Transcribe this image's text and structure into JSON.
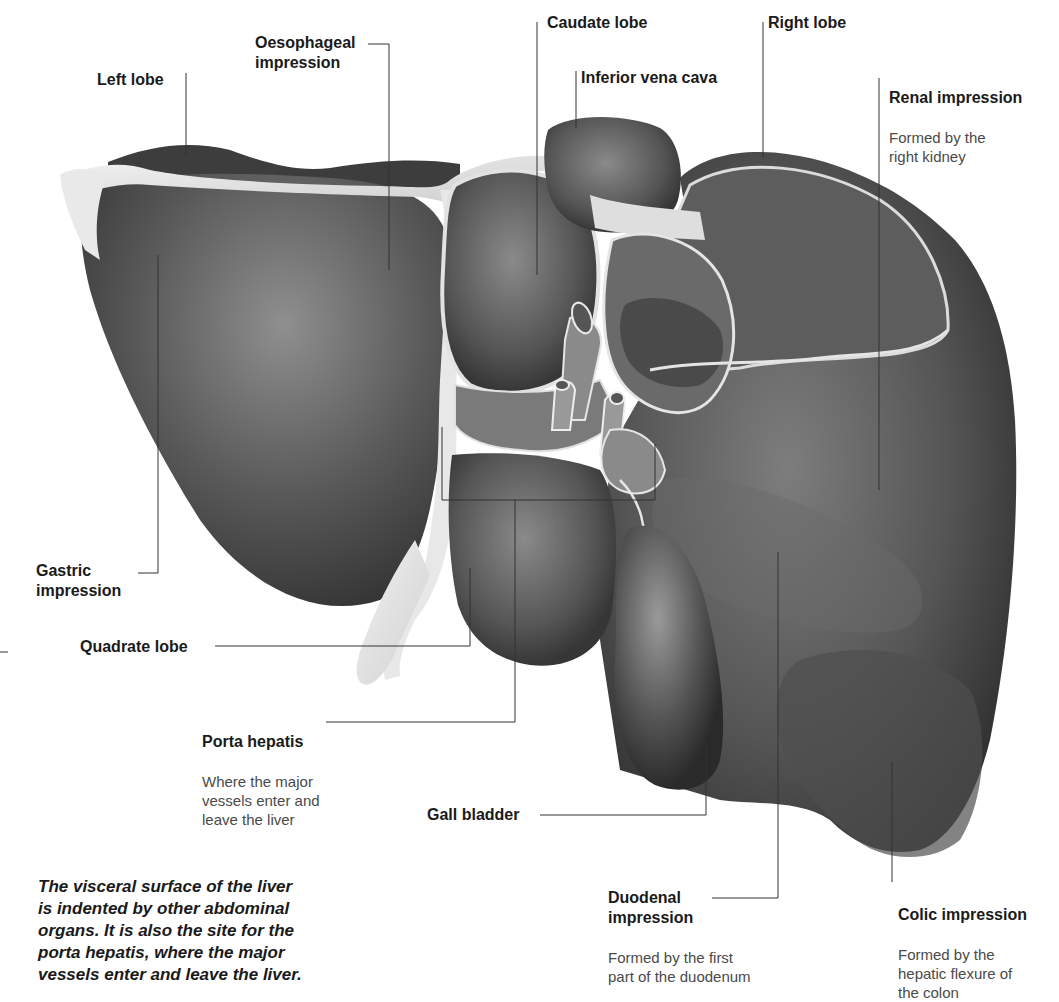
{
  "figure": {
    "subject": "Visceral surface of the liver",
    "colors": {
      "organ_dark": "#3a3a3a",
      "organ_mid": "#6b6b6b",
      "organ_light": "#9a9a9a",
      "ligament": "#e6e6e6",
      "leader_line": "#333333",
      "background": "#ffffff"
    }
  },
  "labels": {
    "left_lobe": {
      "title": "Left lobe"
    },
    "oesophageal_impression": {
      "title": "Oesophageal\nimpression"
    },
    "caudate_lobe": {
      "title": "Caudate lobe"
    },
    "inferior_vena_cava": {
      "title": "Inferior vena cava"
    },
    "right_lobe": {
      "title": "Right lobe"
    },
    "renal_impression": {
      "title": "Renal impression",
      "desc": "Formed by the\nright kidney"
    },
    "gastric_impression": {
      "title": "Gastric\nimpression"
    },
    "quadrate_lobe": {
      "title": "Quadrate lobe"
    },
    "porta_hepatis": {
      "title": "Porta hepatis",
      "desc": "Where the major\nvessels enter and\nleave the liver"
    },
    "gall_bladder": {
      "title": "Gall bladder"
    },
    "duodenal_impression": {
      "title": "Duodenal\nimpression",
      "desc": "Formed by the first\npart of the duodenum"
    },
    "colic_impression": {
      "title": "Colic impression",
      "desc": "Formed by the\nhepatic flexure of\nthe colon"
    }
  },
  "caption": "The visceral surface of the liver\nis indented by other abdominal\norgans. It is also the site for the\nporta hepatis, where the major\nvessels enter and leave the liver."
}
